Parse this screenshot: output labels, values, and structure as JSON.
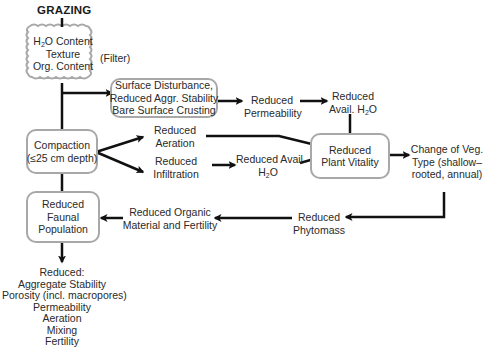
{
  "diagram": {
    "root": "GRAZING",
    "soil_properties": {
      "lines": [
        "H",
        "2",
        "O Content",
        "Texture",
        "Org. Content"
      ],
      "line1_prefix": "H",
      "line1_sub": "2",
      "line1_suffix": "O Content",
      "line2": "Texture",
      "line3": "Org. Content",
      "annotation": "(Filter)"
    },
    "surface_disturbance": {
      "line1": "Surface Disturbance,",
      "line2": "Reduced Aggr. Stability",
      "line3": "Bare Surface Crusting"
    },
    "reduced_permeability": {
      "line1": "Reduced",
      "line2": "Permeability"
    },
    "reduced_avail_h2o_top": {
      "line1": "Reduced",
      "line2_prefix": "Avail. H",
      "line2_sub": "2",
      "line2_suffix": "O"
    },
    "compaction": {
      "line1": "Compaction",
      "line2": "(≤25 cm depth)"
    },
    "reduced_aeration": {
      "line1": "Reduced",
      "line2": "Aeration"
    },
    "reduced_infiltration": {
      "line1": "Reduced",
      "line2": "Infiltration"
    },
    "reduced_avail_h2o_mid": {
      "line1": "Reduced Avail.",
      "line2_prefix": "H",
      "line2_sub": "2",
      "line2_suffix": "O"
    },
    "reduced_plant_vitality": {
      "line1": "Reduced",
      "line2": "Plant Vitality"
    },
    "change_veg_type": {
      "line1": "Change of Veg.",
      "line2": "Type (shallow–",
      "line3": "rooted, annual)"
    },
    "reduced_phytomass": {
      "line1": "Reduced",
      "line2": "Phytomass"
    },
    "reduced_organic": {
      "line1": "Reduced Organic",
      "line2": "Material and Fertility"
    },
    "reduced_faunal": {
      "line1": "Reduced",
      "line2": "Faunal",
      "line3": "Population"
    },
    "reduced_list": {
      "heading": "Reduced:",
      "items": [
        "Aggregate Stability",
        "Porosity (incl. macropores)",
        "Permeability",
        "Aeration",
        "Mixing",
        "Fertility"
      ]
    }
  },
  "colors": {
    "box_border": "#a8a8a8",
    "arrow": "#111111",
    "text": "#2a2a2a"
  }
}
